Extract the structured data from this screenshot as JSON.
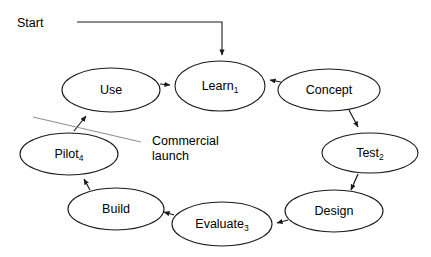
{
  "diagram": {
    "type": "cycle-flow-diagram",
    "background_color": "#ffffff",
    "stroke_color": "#1a1a1a",
    "annotation_color": "#8c8c8c",
    "start_label": "Start",
    "annotation": {
      "line1": "Commercial",
      "line2": "launch"
    },
    "nodes": [
      {
        "id": "learn",
        "label": "Learn",
        "subscript": "1",
        "cx": 220,
        "cy": 86,
        "rx": 45,
        "ry": 25
      },
      {
        "id": "concept",
        "label": "Concept",
        "subscript": "",
        "cx": 329,
        "cy": 90,
        "rx": 51,
        "ry": 21
      },
      {
        "id": "test",
        "label": "Test",
        "subscript": "2",
        "cx": 370,
        "cy": 153,
        "rx": 48,
        "ry": 20
      },
      {
        "id": "design",
        "label": "Design",
        "subscript": "",
        "cx": 334,
        "cy": 211,
        "rx": 49,
        "ry": 21
      },
      {
        "id": "evaluate",
        "label": "Evaluate",
        "subscript": "3",
        "cx": 222,
        "cy": 224,
        "rx": 50,
        "ry": 22
      },
      {
        "id": "build",
        "label": "Build",
        "subscript": "",
        "cx": 116,
        "cy": 209,
        "rx": 48,
        "ry": 21
      },
      {
        "id": "pilot",
        "label": "Pilot",
        "subscript": "4",
        "cx": 69,
        "cy": 154,
        "rx": 49,
        "ry": 21
      },
      {
        "id": "use",
        "label": "Use",
        "subscript": "",
        "cx": 111,
        "cy": 90,
        "rx": 49,
        "ry": 22
      }
    ],
    "edges": [
      {
        "id": "start-to-learn",
        "from": "start",
        "to": "learn"
      },
      {
        "id": "use-to-learn",
        "from": "use",
        "to": "learn"
      },
      {
        "id": "concept-to-learn",
        "from": "concept",
        "to": "learn"
      },
      {
        "id": "concept-to-test",
        "from": "concept",
        "to": "test"
      },
      {
        "id": "test-to-design",
        "from": "test",
        "to": "design"
      },
      {
        "id": "design-to-evaluate",
        "from": "design",
        "to": "evaluate"
      },
      {
        "id": "evaluate-to-build",
        "from": "evaluate",
        "to": "build"
      },
      {
        "id": "build-to-pilot",
        "from": "build",
        "to": "pilot"
      },
      {
        "id": "pilot-to-use",
        "from": "pilot",
        "to": "use"
      }
    ]
  }
}
